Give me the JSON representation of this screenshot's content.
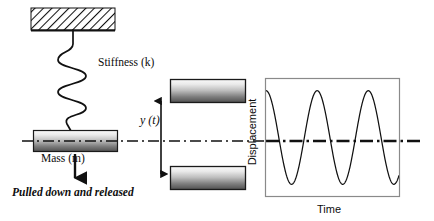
{
  "figure": {
    "labels": {
      "stiffness": "Stiffness (k)",
      "mass": "Mass (m)",
      "displacement_variable": "y (t)",
      "excitation": "Pulled down and released"
    },
    "colors": {
      "stroke": "#0d0d0d",
      "frame": "#8a8a8a",
      "block_light": "#f2f2f2",
      "block_dark": "#4a4a4a",
      "background": "#ffffff"
    },
    "elements": {
      "ceiling": "hatched-fixed-support",
      "spring": "helical-spring",
      "mass_block": "mass-block",
      "block_up": "mass-block-displaced-up",
      "block_down": "mass-block-displaced-down",
      "equilibrium_line": "dash-dot-equilibrium-axis",
      "amplitude_arrow": "double-headed-vertical-arrow",
      "excitation_arrow": "down-arrow"
    }
  },
  "chart_data": {
    "type": "line",
    "title": "",
    "xlabel": "Time",
    "ylabel": "Displacement",
    "grid": false,
    "legend": false,
    "xlim": [
      0,
      1
    ],
    "ylim": [
      -1.25,
      1.25
    ],
    "axis_tick_labels": {
      "x": [],
      "y": []
    },
    "annotations": [
      {
        "name": "equilibrium-line",
        "type": "horizontal-dash-dot",
        "y": 0
      }
    ],
    "series": [
      {
        "name": "Displacement y(t)",
        "form": "cosine",
        "amplitude": 1.0,
        "cycles": 2.6,
        "phase_deg": 0,
        "x": [
          0.0,
          0.02,
          0.04,
          0.06,
          0.08,
          0.1,
          0.12,
          0.14,
          0.16,
          0.18,
          0.2,
          0.22,
          0.24,
          0.26,
          0.28,
          0.3,
          0.32,
          0.34,
          0.36,
          0.38,
          0.4,
          0.42,
          0.44,
          0.46,
          0.48,
          0.5,
          0.52,
          0.54,
          0.56,
          0.58,
          0.6,
          0.62,
          0.64,
          0.66,
          0.68,
          0.7,
          0.72,
          0.74,
          0.76,
          0.78,
          0.8,
          0.82,
          0.84,
          0.86,
          0.88,
          0.9,
          0.92,
          0.94,
          0.96,
          0.98,
          1.0
        ],
        "y": [
          0.95,
          1.0,
          0.97,
          0.87,
          0.69,
          0.45,
          0.17,
          -0.13,
          -0.42,
          -0.67,
          -0.86,
          -0.98,
          -1.0,
          -0.94,
          -0.8,
          -0.59,
          -0.32,
          -0.03,
          0.27,
          0.54,
          0.77,
          0.93,
          1.0,
          0.98,
          0.88,
          0.7,
          0.46,
          0.18,
          -0.12,
          -0.41,
          -0.66,
          -0.85,
          -0.97,
          -1.0,
          -0.94,
          -0.81,
          -0.6,
          -0.33,
          -0.04,
          0.26,
          0.53,
          0.76,
          0.92,
          1.0,
          0.98,
          0.89,
          0.71,
          0.47,
          0.2,
          -0.11,
          -0.4
        ]
      }
    ]
  }
}
